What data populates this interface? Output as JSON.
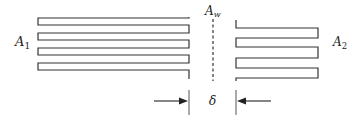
{
  "diagram": {
    "type": "fin-surfaces-across-gap",
    "labels": {
      "left_surface": {
        "main": "A",
        "sub": "1"
      },
      "wall": {
        "main": "A",
        "sub": "w"
      },
      "right_surface": {
        "main": "A",
        "sub": "2"
      },
      "gap": "δ"
    },
    "colors": {
      "stroke": "#333333",
      "background": "#ffffff"
    },
    "left_fins_count": 4,
    "right_fins_count": 3
  }
}
